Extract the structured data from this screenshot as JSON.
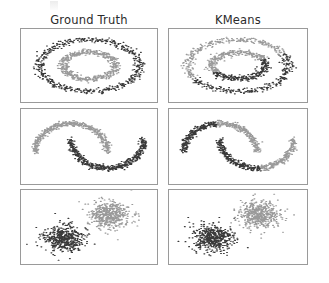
{
  "figure": {
    "background": "#ffffff",
    "columns": [
      {
        "id": "ground-truth",
        "label": "Ground Truth"
      },
      {
        "id": "kmeans",
        "label": "KMeans"
      }
    ],
    "rows": [
      "circles",
      "moons",
      "blobs"
    ],
    "panel_border_color": "#9a9a9a",
    "cluster_colors": {
      "dark": "#1f1f1f",
      "gray": "#8c8c8c"
    }
  },
  "chart_data": [
    {
      "id": "circles-ground-truth",
      "type": "scatter",
      "title": "Ground Truth",
      "dataset": "noisy_circles",
      "xlabel": "",
      "ylabel": "",
      "grid": false,
      "legend": "none",
      "xlim": [
        -1.3,
        1.3
      ],
      "ylim": [
        -1.3,
        1.3
      ],
      "n_points": 1000,
      "series": [
        {
          "name": "cluster_0",
          "color": "#1f1f1f",
          "n": 500,
          "shape": "ring",
          "cx": 0.0,
          "cy": 0.0,
          "radius": 1.0,
          "noise": 0.055
        },
        {
          "name": "cluster_1",
          "color": "#8c8c8c",
          "n": 500,
          "shape": "ring",
          "cx": 0.0,
          "cy": 0.0,
          "radius": 0.52,
          "noise": 0.055
        }
      ],
      "partition": "by-ring"
    },
    {
      "id": "circles-kmeans",
      "type": "scatter",
      "title": "KMeans",
      "dataset": "noisy_circles",
      "xlabel": "",
      "ylabel": "",
      "grid": false,
      "legend": "none",
      "xlim": [
        -1.3,
        1.3
      ],
      "ylim": [
        -1.3,
        1.3
      ],
      "n_points": 1000,
      "series": [
        {
          "name": "cluster_0",
          "color": "#1f1f1f",
          "n": 500,
          "shape": "ring",
          "cx": 0.0,
          "cy": 0.0,
          "radius": 1.0,
          "noise": 0.055
        },
        {
          "name": "cluster_1",
          "color": "#8c8c8c",
          "n": 500,
          "shape": "ring",
          "cx": 0.0,
          "cy": 0.0,
          "radius": 0.52,
          "noise": 0.055
        }
      ],
      "partition": "linear-split",
      "split_angle_deg": 118,
      "note": "KMeans cuts both rings with a straight boundary instead of separating them"
    },
    {
      "id": "moons-ground-truth",
      "type": "scatter",
      "title": "Ground Truth",
      "dataset": "noisy_moons",
      "xlabel": "",
      "ylabel": "",
      "grid": false,
      "legend": "none",
      "xlim": [
        -1.3,
        2.3
      ],
      "ylim": [
        -1.0,
        1.4
      ],
      "n_points": 1000,
      "series": [
        {
          "name": "cluster_0",
          "color": "#8c8c8c",
          "n": 500,
          "shape": "upper-moon",
          "noise": 0.05
        },
        {
          "name": "cluster_1",
          "color": "#1f1f1f",
          "n": 500,
          "shape": "lower-moon",
          "noise": 0.05
        }
      ],
      "partition": "by-moon"
    },
    {
      "id": "moons-kmeans",
      "type": "scatter",
      "title": "KMeans",
      "dataset": "noisy_moons",
      "xlabel": "",
      "ylabel": "",
      "grid": false,
      "legend": "none",
      "xlim": [
        -1.3,
        2.3
      ],
      "ylim": [
        -1.0,
        1.4
      ],
      "n_points": 1000,
      "series": [
        {
          "name": "cluster_0",
          "color": "#1f1f1f",
          "n": 500,
          "shape": "upper-moon",
          "noise": 0.05
        },
        {
          "name": "cluster_1",
          "color": "#8c8c8c",
          "n": 500,
          "shape": "lower-moon",
          "noise": 0.05
        }
      ],
      "partition": "diagonal-split",
      "split_angle_deg": 38,
      "note": "KMeans cuts the moons along a diagonal boundary"
    },
    {
      "id": "blobs-ground-truth",
      "type": "scatter",
      "title": "Ground Truth",
      "dataset": "blobs",
      "xlabel": "",
      "ylabel": "",
      "grid": false,
      "legend": "none",
      "xlim": [
        -4.0,
        4.0
      ],
      "ylim": [
        -3.2,
        3.2
      ],
      "n_points": 1000,
      "series": [
        {
          "name": "cluster_0",
          "color": "#1f1f1f",
          "n": 500,
          "shape": "gaussian",
          "cx": -1.55,
          "cy": -1.05,
          "sigma": 0.62
        },
        {
          "name": "cluster_1",
          "color": "#8c8c8c",
          "n": 500,
          "shape": "gaussian",
          "cx": 1.25,
          "cy": 1.15,
          "sigma": 0.62
        }
      ],
      "partition": "by-blob"
    },
    {
      "id": "blobs-kmeans",
      "type": "scatter",
      "title": "KMeans",
      "dataset": "blobs",
      "xlabel": "",
      "ylabel": "",
      "grid": false,
      "legend": "none",
      "xlim": [
        -4.0,
        4.0
      ],
      "ylim": [
        -3.2,
        3.2
      ],
      "n_points": 1000,
      "series": [
        {
          "name": "cluster_0",
          "color": "#1f1f1f",
          "n": 500,
          "shape": "gaussian",
          "cx": -1.55,
          "cy": -1.05,
          "sigma": 0.62
        },
        {
          "name": "cluster_1",
          "color": "#8c8c8c",
          "n": 500,
          "shape": "gaussian",
          "cx": 1.25,
          "cy": 1.15,
          "sigma": 0.62
        }
      ],
      "partition": "by-blob",
      "note": "KMeans recovers the blobs correctly"
    }
  ]
}
